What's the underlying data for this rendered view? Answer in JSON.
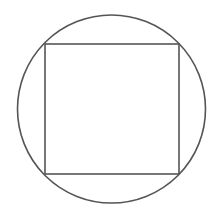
{
  "diagram": {
    "stroke_color": "#555555",
    "background": "#ffffff",
    "circle": {
      "cx": 111.5,
      "cy": 109,
      "r": 94
    },
    "square": {
      "x": 45,
      "y": 44,
      "width": 134,
      "height": 130
    }
  }
}
